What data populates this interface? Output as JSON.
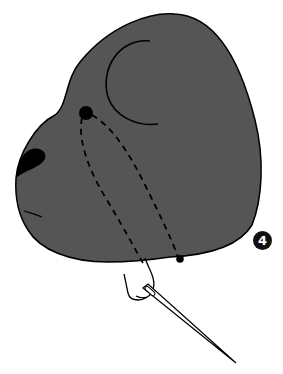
{
  "diagram": {
    "step_number": "4",
    "colors": {
      "head_fill": "#555555",
      "outline": "#000000",
      "background": "#ffffff",
      "badge_fill": "#111111",
      "badge_text": "#ffffff"
    },
    "elements": [
      {
        "name": "head-shape",
        "description": "gray bear head silhouette facing left"
      },
      {
        "name": "ear-curve",
        "description": "C-shaped ear line"
      },
      {
        "name": "eye-dot",
        "description": "black eye position"
      },
      {
        "name": "nose",
        "description": "black nose at left"
      },
      {
        "name": "mouth-line",
        "description": "short mouth line"
      },
      {
        "name": "dashed-thread-paths",
        "description": "two dashed stitching lines from eye down to bottom"
      },
      {
        "name": "exit-dot",
        "description": "thread exit point below head"
      },
      {
        "name": "thread",
        "description": "thread loop"
      },
      {
        "name": "needle",
        "description": "sewing needle pointing down-right"
      }
    ]
  }
}
